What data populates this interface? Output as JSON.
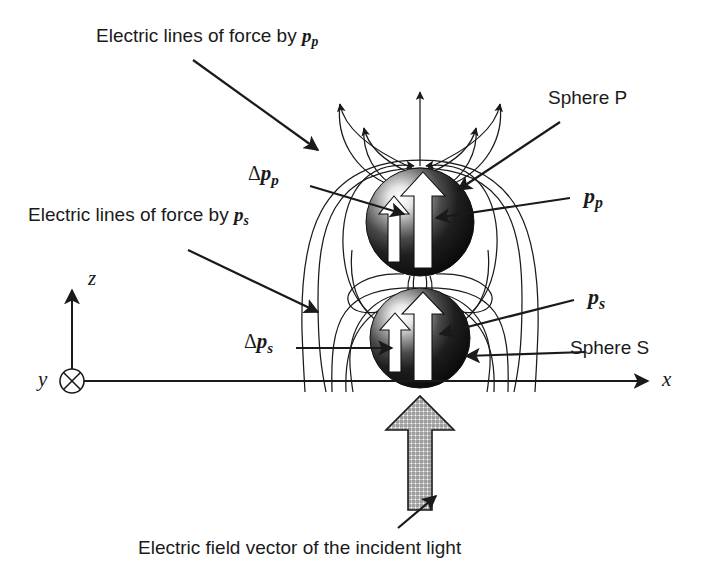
{
  "figure": {
    "background_color": "#ffffff",
    "ink_color": "#1a1a1a",
    "width": 714,
    "height": 573
  },
  "labels": {
    "lines_by_pp": {
      "text_prefix": "Electric lines of force by ",
      "symbol": "p",
      "subscript": "p",
      "full_text": "Electric lines of force by pp"
    },
    "lines_by_ps": {
      "text_prefix": "Electric lines of force by ",
      "symbol": "p",
      "subscript": "s",
      "full_text": "Electric lines of force by ps"
    },
    "delta_pp": {
      "delta": "Δ",
      "symbol": "p",
      "subscript": "p",
      "full_text": "Δpp"
    },
    "delta_ps": {
      "delta": "Δ",
      "symbol": "p",
      "subscript": "s",
      "full_text": "Δps"
    },
    "pp": {
      "symbol": "p",
      "subscript": "p",
      "full_text": "pp"
    },
    "ps": {
      "symbol": "p",
      "subscript": "s",
      "full_text": "ps"
    },
    "sphere_p": "Sphere P",
    "sphere_s": "Sphere S",
    "incident_light": "Electric field vector of the incident light"
  },
  "axes": {
    "x_label": "x",
    "y_label": "y",
    "z_label": "z",
    "y_marker": "into-page-circle-cross",
    "origin": {
      "x": 72,
      "y": 381
    },
    "x_axis_end": {
      "x": 655,
      "y": 381
    },
    "z_axis_top": {
      "x": 72,
      "y": 278
    }
  },
  "spheres": [
    {
      "name": "Sphere P",
      "cx": 420,
      "cy": 222,
      "r": 54,
      "dipole_symbol": "pp",
      "delta_symbol": "Δpp"
    },
    {
      "name": "Sphere S",
      "cx": 420,
      "cy": 338,
      "r": 50,
      "dipole_symbol": "ps",
      "delta_symbol": "Δps"
    }
  ],
  "incident_field_arrow": {
    "description": "hatched vertical arrow pointing up (+z)",
    "tip": {
      "x": 420,
      "y": 398
    },
    "tail": {
      "x": 420,
      "y": 510
    },
    "fill_pattern": "cross-hatch"
  }
}
